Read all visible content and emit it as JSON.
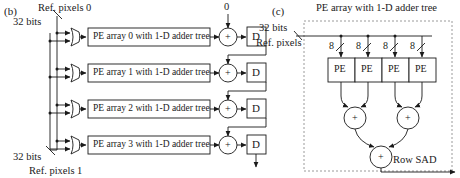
{
  "figure": {
    "panels": [
      {
        "id": "b",
        "tag": "(b)",
        "inputs": [
          {
            "name": "ref-pixels-0",
            "bus_label": "32 bits",
            "signal_label": "Ref. pixels 0"
          },
          {
            "name": "ref-pixels-1",
            "bus_label": "32 bits",
            "signal_label": "Ref. pixels 1"
          }
        ],
        "const_input": "0",
        "rows": [
          {
            "pe_label": "PE array 0 with 1-D adder tree",
            "adder": "+",
            "reg": "D"
          },
          {
            "pe_label": "PE array 1 with 1-D adder tree",
            "adder": "+",
            "reg": "D"
          },
          {
            "pe_label": "PE array 2 with 1-D adder tree",
            "adder": "+",
            "reg": "D"
          },
          {
            "pe_label": "PE array 3 with 1-D adder tree",
            "adder": "+",
            "reg": "D"
          }
        ]
      },
      {
        "id": "c",
        "tag": "(c)",
        "title": "PE array with 1-D adder tree",
        "bus_label": "32 bits",
        "signal_label": "Ref. pixels",
        "tap_widths": [
          "8",
          "8",
          "8",
          "8"
        ],
        "pe_cells": [
          "PE",
          "PE",
          "PE",
          "PE"
        ],
        "adders_level1": [
          "+",
          "+"
        ],
        "adder_level2": "+",
        "output_label": "Row SAD"
      }
    ]
  },
  "colors": {
    "stroke": "#1a1a1a",
    "fill": "#ffffff",
    "dashed": "#9a9a9a"
  }
}
